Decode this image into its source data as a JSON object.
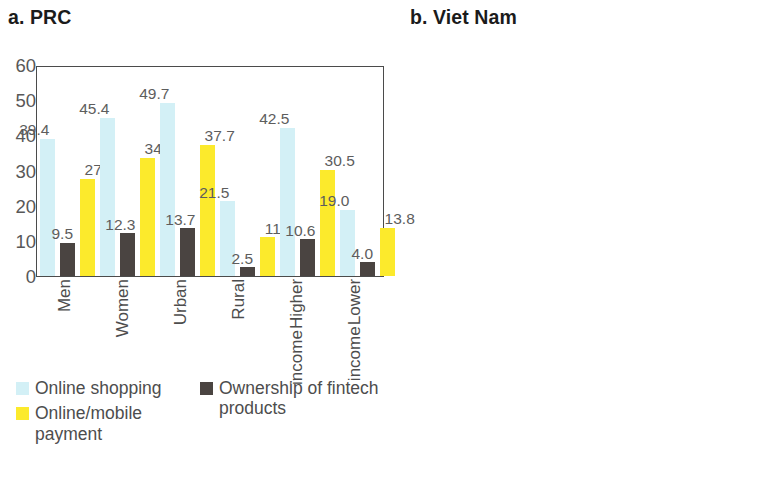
{
  "chart_data": [
    {
      "type": "bar",
      "title": "a. PRC",
      "xlabel": "",
      "ylabel": "",
      "ylim": [
        0,
        60
      ],
      "yticks": [
        0,
        10,
        20,
        30,
        40,
        50,
        60
      ],
      "grid": false,
      "legend_position": "bottom-left",
      "categories": [
        "Men",
        "Women",
        "Urban",
        "Rural",
        "Higher income",
        "Lower income"
      ],
      "series": [
        {
          "name": "Online shopping",
          "color": "#D3F0F6",
          "values": [
            39.4,
            45.4,
            49.7,
            21.5,
            42.5,
            19.0
          ],
          "labels": [
            "39.4",
            "45.4",
            "49.7",
            "21.5",
            "42.5",
            "19.0"
          ]
        },
        {
          "name": "Ownership of fintech products",
          "color": "#4A4441",
          "values": [
            9.5,
            12.3,
            13.7,
            2.5,
            10.6,
            4.0
          ],
          "labels": [
            "9.5",
            "12.3",
            "13.7",
            "2.5",
            "10.6",
            "4.0"
          ]
        },
        {
          "name": "Online/mobile payment",
          "color": "#FCEA2C",
          "values": [
            27.9,
            34.0,
            37.7,
            11.2,
            30.5,
            13.8
          ],
          "labels": [
            "27.9",
            "34.0",
            "37.7",
            "11.2",
            "30.5",
            "13.8"
          ]
        }
      ]
    },
    {
      "type": "bar",
      "title": "b. Viet Nam",
      "xlabel": "",
      "ylabel": "",
      "ylim": [
        0,
        90
      ],
      "yticks": [
        0,
        10,
        20,
        30,
        40,
        50,
        60,
        70,
        80,
        90
      ],
      "grid": false,
      "legend_position": "bottom-right",
      "categories": [
        "Men",
        "Women",
        "Urban",
        "Rural",
        "Higher income",
        "Lower income"
      ],
      "series": [
        {
          "name": "Awareness of at least one digital product",
          "color": "#6FE2F0",
          "values": [
            66.8,
            60.2,
            77.4,
            46.1,
            69.5,
            47.4
          ],
          "labels": [
            "66.8",
            "60.2",
            "77.4",
            "46.1",
            "69.5",
            "47.4"
          ]
        },
        {
          "name": "Smart banking services",
          "color": "#EDEDE8",
          "values": [
            18.0,
            15.0,
            26.3,
            4.6,
            21.2,
            4.7
          ],
          "labels": [
            "18.0",
            "15.0",
            "26.3",
            "4.6",
            "21.2",
            "4.7"
          ]
        },
        {
          "name": "E-payment services",
          "color": "#F4714E",
          "values": [
            13.2,
            11.3,
            19.5,
            3.4,
            15.9,
            3.1
          ],
          "labels": [
            "13.2",
            "11.3",
            "19.5",
            "3.4",
            "15.9",
            "3.1"
          ]
        },
        {
          "name": "E-transfer services",
          "color": "#D7E83B",
          "values": [
            10.5,
            11.1,
            17.4,
            3.4,
            14.5,
            2.5
          ],
          "labels": [
            "10.5",
            "11.1",
            "17.4",
            "3.4",
            "14.5",
            "2.5"
          ]
        }
      ]
    }
  ],
  "panel_a": {
    "title": "a. PRC",
    "yticks": [
      "60",
      "50",
      "40",
      "30",
      "20",
      "10",
      "0"
    ],
    "categories": [
      {
        "line1": "Men",
        "line2": ""
      },
      {
        "line1": "Women",
        "line2": ""
      },
      {
        "line1": "Urban",
        "line2": ""
      },
      {
        "line1": "Rural",
        "line2": ""
      },
      {
        "line1": "Higher",
        "line2": "income"
      },
      {
        "line1": "Lower",
        "line2": "income"
      }
    ],
    "legend_col1": [
      {
        "label": "Online shopping",
        "color": "#D3F0F6"
      },
      {
        "label": "Online/mobile payment",
        "color": "#FCEA2C"
      }
    ],
    "legend_col2": [
      {
        "label": "Ownership of fintech products",
        "color": "#4A4441"
      }
    ]
  },
  "panel_b": {
    "title": "b. Viet Nam",
    "yticks": [
      "90",
      "80",
      "70",
      "60",
      "50",
      "40",
      "30",
      "20",
      "10",
      "0"
    ],
    "categories": [
      {
        "line1": "Men",
        "line2": ""
      },
      {
        "line1": "Women",
        "line2": ""
      },
      {
        "line1": "Urban",
        "line2": ""
      },
      {
        "line1": "Rural",
        "line2": ""
      },
      {
        "line1": "Higher",
        "line2": "income"
      },
      {
        "line1": "Lower",
        "line2": "income"
      }
    ],
    "legend": [
      {
        "label": "Awareness of at least one digital product",
        "color": "#6FE2F0"
      },
      {
        "label": "Smart banking services",
        "color": "#EDEDE8"
      },
      {
        "label": "E-payment services",
        "color": "#F4714E"
      },
      {
        "label": "E-transfer services",
        "color": "#D7E83B"
      }
    ]
  }
}
